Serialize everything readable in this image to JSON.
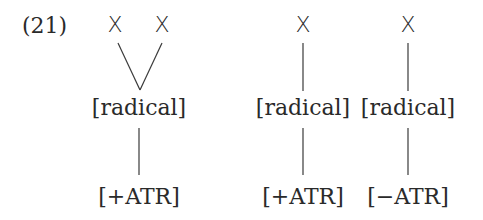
{
  "example": {
    "number": "(21)"
  },
  "structures": [
    {
      "timing_slots": [
        "X",
        "X"
      ],
      "feature_node": "[radical]",
      "dependent": "[+ATR]",
      "association": "two slots linked to one [radical] node"
    },
    {
      "timing_slots": [
        "X"
      ],
      "feature_node": "[radical]",
      "dependent": "[+ATR]",
      "association": "one slot linked to one [radical] node"
    },
    {
      "timing_slots": [
        "X"
      ],
      "feature_node": "[radical]",
      "dependent": "[−ATR]",
      "association": "one slot linked to one [radical] node"
    }
  ]
}
